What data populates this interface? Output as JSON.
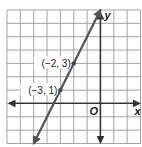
{
  "chart_data": {
    "type": "line",
    "title": "",
    "xlabel": "x",
    "ylabel": "y",
    "origin_label": "O",
    "xlim": [
      -7,
      3
    ],
    "ylim": [
      -3,
      7
    ],
    "grid": true,
    "grid_step": 1,
    "series": [
      {
        "name": "line through (-3, 1) and (-2, 3)",
        "equation": "y = 2x + 7",
        "x": [
          -5,
          -3,
          -2,
          0
        ],
        "y": [
          -3,
          1,
          3,
          7
        ],
        "arrows": "both"
      }
    ],
    "points": [
      {
        "x": -2,
        "y": 3,
        "label": "(−2, 3)"
      },
      {
        "x": -3,
        "y": 1,
        "label": "(−3, 1)"
      }
    ]
  },
  "colors": {
    "grid": "#9a9a9a",
    "axes": "#333333",
    "line": "#555555",
    "point": "#444444"
  }
}
